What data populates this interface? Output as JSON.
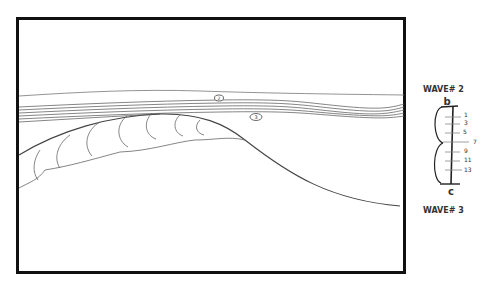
{
  "frame": {
    "description": "Storyboard frame: cross-section sketch of ocean waves with breaking wave crest",
    "markers": [
      {
        "id": "marker-2",
        "label": "2",
        "x": 219,
        "y": 98
      },
      {
        "id": "marker-3",
        "label": "3",
        "x": 256,
        "y": 117
      }
    ]
  },
  "legend": {
    "top_label": "WAVE# 2",
    "top_letter": "b",
    "bottom_letter": "c",
    "bottom_label": "WAVE# 3",
    "ticks": [
      "1",
      "3",
      "5",
      "7",
      "9",
      "11",
      "13"
    ]
  }
}
